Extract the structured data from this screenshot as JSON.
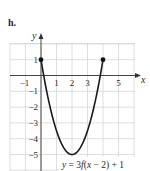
{
  "panel_label": "h.",
  "chart_data": {
    "type": "line",
    "title": "",
    "equation_label": "y = 3f(x − 2) + 1",
    "xlabel": "x",
    "ylabel": "y",
    "xlim": [
      -2,
      6
    ],
    "ylim": [
      -6,
      2
    ],
    "grid": true,
    "x_ticks": [
      "−1",
      "1",
      "2",
      "3",
      "5"
    ],
    "y_ticks": [
      "1",
      "−1",
      "−2",
      "−3",
      "−4",
      "−5"
    ],
    "series": [
      {
        "name": "y = 3f(x − 2) + 1",
        "points": [
          [
            0,
            1
          ],
          [
            0.5,
            -2.375
          ],
          [
            1,
            -4.25
          ],
          [
            1.5,
            -4.8125
          ],
          [
            2,
            -5
          ],
          [
            2.5,
            -4.8125
          ],
          [
            3,
            -4.25
          ],
          [
            3.5,
            -2.375
          ],
          [
            4,
            1
          ]
        ],
        "endpoints_closed": [
          [
            0,
            1
          ],
          [
            4,
            1
          ]
        ],
        "vertex": [
          2,
          -5
        ]
      }
    ]
  }
}
